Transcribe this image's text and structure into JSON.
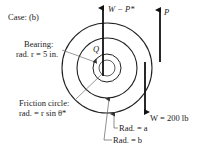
{
  "case_label": "Case: (b)",
  "labels": {
    "bearing_line1": "Bearing:",
    "bearing_line2": "rad. r = 5 in.",
    "friction_line1": "Friction circle:",
    "friction_line2": "rad. = r sin θ*",
    "force_top_left": "W − P*",
    "force_top_right": "P",
    "force_bottom": "W = 200 lb",
    "point_q": "Q",
    "rad_a": "Rad. = a",
    "rad_b": "Rad. = b"
  },
  "geometry": {
    "center": [
      107,
      68
    ],
    "circle_radii": [
      8,
      14,
      30,
      45
    ],
    "stroke_color": "#222222"
  }
}
